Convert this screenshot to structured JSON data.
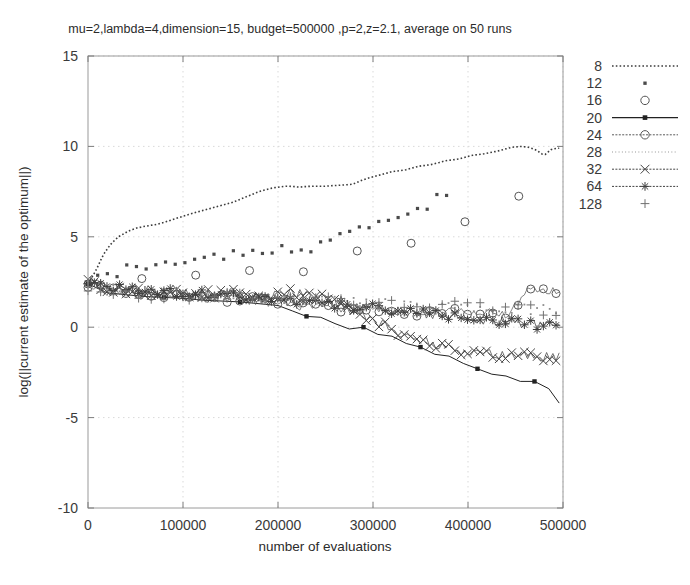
{
  "chart_data": {
    "type": "line",
    "title": "mu=2,lambda=4,dimension=15, budget=500000 ,p=2,z=2.1, average on 50 runs",
    "xlabel": "number of evaluations",
    "ylabel": "log(||current estimate of the optimum||)",
    "xlim": [
      0,
      500000
    ],
    "ylim": [
      -10,
      15
    ],
    "xticks": [
      "0",
      "100000",
      "200000",
      "300000",
      "400000",
      "500000"
    ],
    "xtick_values": [
      0,
      100000,
      200000,
      300000,
      400000,
      500000
    ],
    "yticks": [
      "15",
      "10",
      "5",
      "0",
      "-5",
      "-10"
    ],
    "ytick_values": [
      15,
      10,
      5,
      0,
      -5,
      -10
    ],
    "grid": true,
    "legend_position": "right-outside",
    "legend_title": "",
    "series": [
      {
        "name": "8",
        "style": "dotted-line",
        "marker": "none",
        "color": "#3c3c3c",
        "x": [
          0,
          8000,
          16000,
          24000,
          32000,
          42000,
          52000,
          62000,
          74000,
          86000,
          98000,
          110000,
          124000,
          138000,
          152000,
          166000,
          180000,
          194000,
          208000,
          212000,
          222000,
          236000,
          250000,
          264000,
          278000,
          292000,
          306000,
          320000,
          334000,
          348000,
          362000,
          376000,
          390000,
          404000,
          418000,
          432000,
          446000,
          456000,
          464000,
          472000,
          480000,
          488000,
          496000
        ],
        "y": [
          2.4,
          3.1,
          4.0,
          4.6,
          5.0,
          5.3,
          5.5,
          5.6,
          5.7,
          5.9,
          6.1,
          6.3,
          6.5,
          6.7,
          6.9,
          7.2,
          7.5,
          7.7,
          7.8,
          7.8,
          7.75,
          7.8,
          7.8,
          7.85,
          7.9,
          8.2,
          8.4,
          8.6,
          8.7,
          8.9,
          9.0,
          9.2,
          9.3,
          9.5,
          9.6,
          9.75,
          9.95,
          10.0,
          9.95,
          9.8,
          9.5,
          9.85,
          9.9
        ]
      },
      {
        "name": "12",
        "style": "points",
        "marker": "dot",
        "color": "#4a4a4a",
        "x": [
          0,
          20000,
          40000,
          60000,
          80000,
          100000,
          120000,
          140000,
          160000,
          180000,
          200000,
          215000,
          230000,
          245000,
          260000,
          275000,
          290000,
          305000,
          320000,
          335000,
          350000,
          365000,
          380000
        ],
        "y": [
          2.3,
          2.9,
          3.2,
          3.4,
          3.6,
          3.75,
          3.85,
          4.0,
          4.1,
          4.25,
          4.4,
          4.2,
          4.3,
          4.5,
          4.9,
          5.3,
          5.5,
          5.7,
          5.9,
          6.2,
          6.6,
          7.0,
          7.5
        ]
      },
      {
        "name": "16",
        "style": "circles",
        "marker": "open-circle",
        "color": "#555555",
        "x": [
          0,
          15000,
          30000,
          45000,
          60000,
          75000,
          90000,
          105000,
          120000,
          135000,
          150000,
          165000,
          180000,
          195000,
          210000,
          222000,
          236000,
          250000,
          264000,
          278000,
          292000,
          306000,
          318000,
          330000,
          344000,
          358000,
          372000,
          386000,
          400000,
          414000,
          428000,
          442000,
          456000,
          470000,
          484000,
          496000
        ],
        "y": [
          2.2,
          2.5,
          2.6,
          2.65,
          2.7,
          2.75,
          2.8,
          2.85,
          2.9,
          2.95,
          3.0,
          3.1,
          3.2,
          3.3,
          3.2,
          3.0,
          3.2,
          3.5,
          3.8,
          4.1,
          4.4,
          4.6,
          4.8,
          4.5,
          4.7,
          5.0,
          5.3,
          5.6,
          5.9,
          6.3,
          6.7,
          7.0,
          7.3,
          7.25,
          7.2,
          7.3
        ]
      },
      {
        "name": "20",
        "style": "solid-line",
        "marker": "filled-square",
        "color": "#222222",
        "x": [
          0,
          20000,
          40000,
          60000,
          80000,
          100000,
          120000,
          140000,
          160000,
          180000,
          200000,
          215000,
          230000,
          245000,
          260000,
          275000,
          290000,
          305000,
          320000,
          335000,
          350000,
          365000,
          380000,
          395000,
          410000,
          425000,
          440000,
          455000,
          470000,
          485000,
          496000
        ],
        "y": [
          2.4,
          1.9,
          1.8,
          1.7,
          1.65,
          1.6,
          1.5,
          1.45,
          1.4,
          1.3,
          1.2,
          0.9,
          0.6,
          0.55,
          0.2,
          -0.1,
          0.0,
          -0.4,
          -0.5,
          -0.9,
          -1.1,
          -1.5,
          -1.6,
          -2.0,
          -2.3,
          -2.6,
          -2.7,
          -3.0,
          -3.0,
          -3.4,
          -4.2
        ]
      },
      {
        "name": "24",
        "style": "line-circles",
        "marker": "open-circle",
        "color": "#5a5a5a",
        "x": [
          0,
          20000,
          40000,
          60000,
          80000,
          100000,
          120000,
          140000,
          160000,
          180000,
          200000,
          220000,
          240000,
          260000,
          280000,
          300000,
          320000,
          340000,
          360000,
          380000,
          400000,
          420000,
          440000,
          452000,
          462000,
          470000,
          480000,
          490000,
          496000
        ],
        "y": [
          2.3,
          2.0,
          1.9,
          1.85,
          1.8,
          1.7,
          1.65,
          1.6,
          1.5,
          1.4,
          1.3,
          1.2,
          1.1,
          1.0,
          1.05,
          0.95,
          0.9,
          0.85,
          0.9,
          0.8,
          0.85,
          0.8,
          0.75,
          1.2,
          2.1,
          2.0,
          1.9,
          2.0,
          2.05
        ]
      },
      {
        "name": "28",
        "style": "fine-dots",
        "marker": "tiny-dot",
        "color": "#8c8c8c",
        "x": [
          0,
          20000,
          40000,
          60000,
          80000,
          100000,
          120000,
          140000,
          160000,
          180000,
          200000,
          220000,
          240000,
          260000,
          280000,
          300000,
          320000,
          340000,
          360000,
          380000,
          400000,
          420000,
          440000,
          460000,
          480000,
          496000
        ],
        "y": [
          2.5,
          2.2,
          2.1,
          2.0,
          1.95,
          1.9,
          1.85,
          1.8,
          1.75,
          1.7,
          1.6,
          1.55,
          1.5,
          1.45,
          1.4,
          1.35,
          1.3,
          1.25,
          1.2,
          1.15,
          1.1,
          1.05,
          1.0,
          1.0,
          0.95,
          1.0
        ]
      },
      {
        "name": "32",
        "style": "line-x",
        "marker": "x-cross",
        "color": "#444444",
        "x": [
          0,
          20000,
          40000,
          60000,
          80000,
          100000,
          120000,
          140000,
          160000,
          180000,
          200000,
          215000,
          230000,
          245000,
          260000,
          275000,
          290000,
          305000,
          320000,
          335000,
          350000,
          365000,
          380000,
          395000,
          410000,
          425000,
          440000,
          455000,
          470000,
          485000,
          496000
        ],
        "y": [
          2.5,
          2.1,
          2.0,
          1.95,
          1.9,
          1.85,
          1.8,
          1.85,
          1.9,
          1.8,
          1.75,
          2.0,
          1.7,
          1.6,
          1.4,
          1.0,
          0.6,
          0.2,
          -0.1,
          -0.4,
          -0.7,
          -1.0,
          -1.2,
          -1.35,
          -1.4,
          -1.45,
          -1.5,
          -1.55,
          -1.6,
          -1.6,
          -1.6
        ]
      },
      {
        "name": "64",
        "style": "line-asterisk",
        "marker": "asterisk",
        "color": "#3f3f3f",
        "x": [
          0,
          20000,
          40000,
          60000,
          80000,
          100000,
          120000,
          140000,
          160000,
          180000,
          200000,
          220000,
          240000,
          260000,
          280000,
          300000,
          320000,
          340000,
          360000,
          380000,
          400000,
          420000,
          440000,
          460000,
          480000,
          496000
        ],
        "y": [
          2.6,
          2.3,
          2.2,
          2.1,
          2.0,
          1.95,
          1.9,
          1.85,
          1.8,
          1.7,
          1.6,
          1.5,
          1.4,
          1.3,
          1.2,
          1.05,
          0.9,
          0.8,
          0.7,
          0.6,
          0.5,
          0.4,
          0.3,
          0.2,
          0.1,
          0.1
        ]
      },
      {
        "name": "128",
        "style": "points",
        "marker": "plus",
        "color": "#707070",
        "x": [
          0,
          20000,
          40000,
          60000,
          80000,
          100000,
          120000,
          140000,
          160000,
          180000,
          200000,
          220000,
          240000,
          260000,
          280000,
          300000,
          320000,
          340000,
          360000,
          380000,
          400000,
          420000,
          440000,
          460000,
          480000,
          496000
        ],
        "y": [
          2.2,
          1.9,
          1.85,
          1.8,
          1.8,
          1.75,
          1.7,
          1.7,
          1.65,
          1.6,
          1.6,
          1.55,
          1.5,
          1.5,
          1.45,
          1.4,
          1.4,
          1.35,
          1.3,
          1.3,
          1.25,
          1.2,
          1.1,
          1.0,
          0.9,
          0.85
        ]
      }
    ]
  },
  "legend": {
    "items": [
      {
        "label": "8"
      },
      {
        "label": "12"
      },
      {
        "label": "16"
      },
      {
        "label": "20"
      },
      {
        "label": "24"
      },
      {
        "label": "28"
      },
      {
        "label": "32"
      },
      {
        "label": "64"
      },
      {
        "label": "128"
      }
    ]
  }
}
